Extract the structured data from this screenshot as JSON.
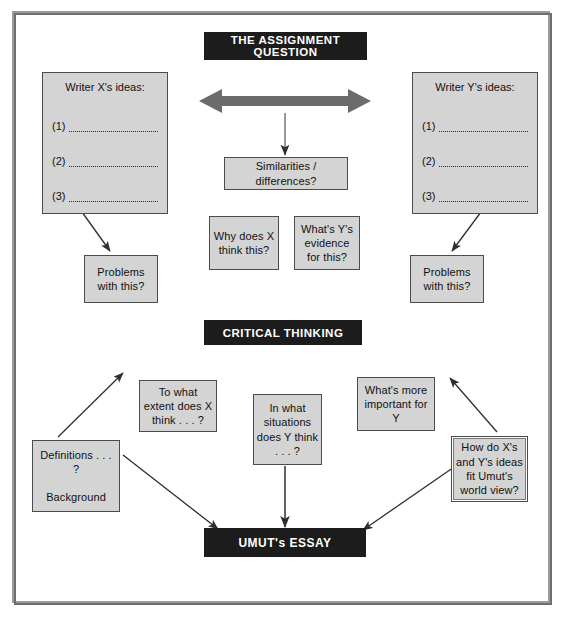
{
  "diagram": {
    "title_banner": "THE ASSIGNMENT QUESTION",
    "critical_banner": "CRITICAL THINKING",
    "essay_banner": "UMUT's ESSAY",
    "colors": {
      "banner_bg": "#1c1c1c",
      "banner_text": "#ffffff",
      "node_bg": "#d4d4d4",
      "node_border": "#4c4c4c",
      "arrow": "#3a3a3a",
      "double_arrow": "#6b6b6b",
      "frame": "#6e6e6e",
      "page_bg": "#ffffff"
    }
  },
  "panels": {
    "left": {
      "title": "Writer X's ideas:",
      "rows": [
        "(1)",
        "(2)",
        "(3)"
      ]
    },
    "right": {
      "title": "Writer Y's ideas:",
      "rows": [
        "(1)",
        "(2)",
        "(3)"
      ]
    }
  },
  "nodes": {
    "similarities": "Similarities / differences?",
    "why_does_x": "Why does X think this?",
    "whats_y_evidence": "What's Y's evidence for this?",
    "problems_left": "Problems with this?",
    "problems_right": "Problems with this?",
    "to_what_extent": "To what extent does X think . . . ?",
    "in_what_situations": "In what situations does Y think . . . ?",
    "whats_more_important": "What's more important for Y",
    "how_do_ideas_fit": "How do X's and Y's ideas fit Umut's world view?",
    "definitions": "Definitions . . . ?",
    "background": "Background"
  }
}
